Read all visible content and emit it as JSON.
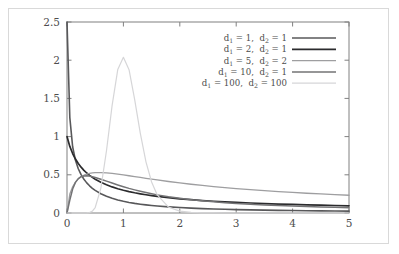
{
  "chart_data": {
    "type": "line",
    "title": "",
    "xlabel": "",
    "ylabel": "",
    "xlim": [
      0,
      5
    ],
    "ylim": [
      0,
      2.5
    ],
    "grid": false,
    "legend_position": "upper right",
    "x_ticks": [
      "0",
      "1",
      "2",
      "3",
      "4",
      "5"
    ],
    "x_tick_values": [
      0,
      1,
      2,
      3,
      4,
      5
    ],
    "y_ticks": [
      "0",
      "0.5",
      "1",
      "1.5",
      "2",
      "2.5"
    ],
    "y_tick_values": [
      0,
      0.5,
      1,
      1.5,
      2,
      2.5
    ],
    "x": [
      0.0,
      0.05,
      0.1,
      0.15,
      0.2,
      0.25,
      0.3,
      0.35,
      0.4,
      0.45,
      0.5,
      0.6,
      0.7,
      0.8,
      0.9,
      1.0,
      1.1,
      1.2,
      1.3,
      1.4,
      1.5,
      1.6,
      1.8,
      2.0,
      2.2,
      2.4,
      2.6,
      2.8,
      3.0,
      3.25,
      3.5,
      3.75,
      4.0,
      4.25,
      4.5,
      4.75,
      5.0
    ],
    "series": [
      {
        "name": "d1 = 1, d2 = 1",
        "d1": 1,
        "d2": 1,
        "color": "#58585a",
        "width": 1.6,
        "values": [
          2.5,
          1.249,
          0.8672,
          0.6899,
          0.5796,
          0.5013,
          0.4417,
          0.3944,
          0.3558,
          0.3235,
          0.2961,
          0.2521,
          0.2183,
          0.1917,
          0.1703,
          0.1527,
          0.1381,
          0.1258,
          0.1153,
          0.1063,
          0.0984,
          0.0915,
          0.0801,
          0.0711,
          0.0638,
          0.0578,
          0.0528,
          0.0485,
          0.0448,
          0.0407,
          0.0373,
          0.0343,
          0.0318,
          0.0295,
          0.0276,
          0.0258,
          0.0243
        ]
      },
      {
        "name": "d1 = 2, d2 = 1",
        "d1": 2,
        "d2": 1,
        "color": "#2b2b2d",
        "width": 1.7,
        "values": [
          1.0,
          0.8714,
          0.7783,
          0.7062,
          0.6479,
          0.5996,
          0.5587,
          0.5236,
          0.493,
          0.4661,
          0.4423,
          0.4018,
          0.3688,
          0.3412,
          0.3178,
          0.2976,
          0.2801,
          0.2647,
          0.251,
          0.2388,
          0.2279,
          0.218,
          0.2006,
          0.1861,
          0.1738,
          0.1632,
          0.154,
          0.1459,
          0.1387,
          0.1307,
          0.1237,
          0.1174,
          0.1118,
          0.1068,
          0.1022,
          0.098,
          0.0942
        ]
      },
      {
        "name": "d1 = 5, d2 = 2",
        "d1": 5,
        "d2": 2,
        "color": "#9e9ea0",
        "width": 1.3,
        "values": [
          0.0,
          0.2478,
          0.3438,
          0.4046,
          0.4458,
          0.4743,
          0.4944,
          0.5083,
          0.5178,
          0.5239,
          0.5274,
          0.5289,
          0.525,
          0.5179,
          0.5087,
          0.4984,
          0.4875,
          0.4763,
          0.4651,
          0.454,
          0.4431,
          0.4325,
          0.4123,
          0.3936,
          0.3763,
          0.3604,
          0.3456,
          0.332,
          0.3194,
          0.305,
          0.2919,
          0.2799,
          0.2689,
          0.2587,
          0.2493,
          0.2406,
          0.2325
        ]
      },
      {
        "name": "d1 = 10, d2 = 1",
        "d1": 10,
        "d2": 1,
        "color": "#737375",
        "width": 1.5,
        "values": [
          0.0,
          0.169,
          0.3142,
          0.4011,
          0.4497,
          0.4747,
          0.4853,
          0.4869,
          0.4828,
          0.4752,
          0.4654,
          0.4424,
          0.4173,
          0.3919,
          0.3673,
          0.344,
          0.3223,
          0.3023,
          0.2839,
          0.267,
          0.2515,
          0.2373,
          0.2126,
          0.1918,
          0.1742,
          0.1592,
          0.1463,
          0.135,
          0.1252,
          0.1145,
          0.1053,
          0.0973,
          0.0903,
          0.0841,
          0.0786,
          0.0737,
          0.0693
        ]
      },
      {
        "name": "d1 = 100, d2 = 100",
        "d1": 100,
        "d2": 100,
        "color": "#d6d6d8",
        "width": 1.2,
        "values": [
          0.0,
          0.0,
          0.0,
          0.0,
          0.0,
          0.0,
          0.0001,
          0.001,
          0.006,
          0.0243,
          0.0718,
          0.3231,
          0.8152,
          1.4086,
          1.8775,
          2.038,
          1.8757,
          1.4851,
          1.0426,
          0.67,
          0.4055,
          0.2362,
          0.0768,
          0.0246,
          0.008,
          0.0027,
          0.0009,
          0.0003,
          0.0001,
          0.0,
          0.0,
          0.0,
          0.0,
          0.0,
          0.0,
          0.0,
          0.0
        ]
      }
    ]
  },
  "axes": {
    "x_tick_labels": [
      "0",
      "1",
      "2",
      "3",
      "4",
      "5"
    ],
    "y_tick_labels": [
      "0",
      "0.5",
      "1",
      "1.5",
      "2",
      "2.5"
    ]
  },
  "legend": {
    "entries": [
      {
        "d1_label": "d",
        "d1_sub": "1",
        "d1_eq": "= 1,",
        "d2_label": "d",
        "d2_sub": "2",
        "d2_eq": "= 1",
        "text": "d1 = 1,  d2 = 1",
        "color": "#58585a"
      },
      {
        "d1_label": "d",
        "d1_sub": "1",
        "d1_eq": "= 2,",
        "d2_label": "d",
        "d2_sub": "2",
        "d2_eq": "= 1",
        "text": "d1 = 2,  d2 = 1",
        "color": "#2b2b2d"
      },
      {
        "d1_label": "d",
        "d1_sub": "1",
        "d1_eq": "= 5,",
        "d2_label": "d",
        "d2_sub": "2",
        "d2_eq": "= 2",
        "text": "d1 = 5,  d2 = 2",
        "color": "#9e9ea0"
      },
      {
        "d1_label": "d",
        "d1_sub": "1",
        "d1_eq": "= 10,",
        "d2_label": "d",
        "d2_sub": "2",
        "d2_eq": "= 1",
        "text": "d1 = 10,  d2 = 1",
        "color": "#737375"
      },
      {
        "d1_label": "d",
        "d1_sub": "1",
        "d1_eq": "= 100,",
        "d2_label": "d",
        "d2_sub": "2",
        "d2_eq": "= 100",
        "text": "d1 = 100,  d2 = 100",
        "color": "#d6d6d8"
      }
    ]
  },
  "style": {
    "frame_color": "#808080",
    "tick_color": "#808080",
    "text_color": "#4d4d4d",
    "border_color": "#d9d9d9",
    "background": "#ffffff"
  }
}
